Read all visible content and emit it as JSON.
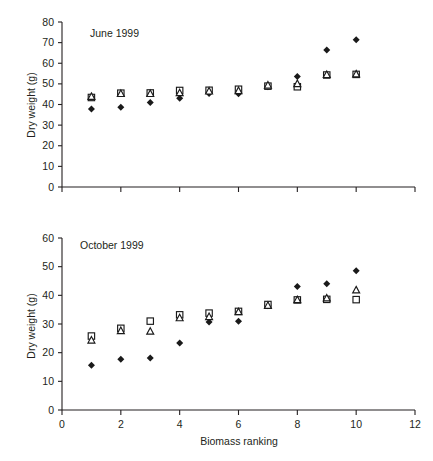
{
  "figure": {
    "background": "#ffffff",
    "ink_color": "#231f20",
    "marker_color": "#1a1a1a"
  },
  "chart_data": [
    {
      "type": "scatter",
      "panel_id": "top",
      "title": "June 1999",
      "xlabel": "",
      "ylabel": "Dry weight (g)",
      "xlim": [
        0,
        12
      ],
      "ylim": [
        0,
        80
      ],
      "xticks": [
        0,
        2,
        4,
        6,
        8,
        10,
        12
      ],
      "xticklabels": [
        "",
        "",
        "",
        "",
        "",
        "",
        ""
      ],
      "yticks": [
        0,
        10,
        20,
        30,
        40,
        50,
        60,
        70,
        80
      ],
      "yticklabels": [
        "0",
        "10",
        "20",
        "30",
        "40",
        "50",
        "60",
        "70",
        "80"
      ],
      "grid": false,
      "legend": "none",
      "x": [
        1,
        2,
        3,
        4,
        5,
        6,
        7,
        8,
        9,
        10
      ],
      "series": [
        {
          "name": "filled-diamond",
          "marker": "diamond-filled",
          "values": [
            37.8,
            38.7,
            41.0,
            43.0,
            45.3,
            45.2,
            48.6,
            53.6,
            66.4,
            71.4
          ]
        },
        {
          "name": "open-square",
          "marker": "square-open",
          "values": [
            43.4,
            45.5,
            45.6,
            46.8,
            46.9,
            47.4,
            48.9,
            48.6,
            54.3,
            54.6
          ]
        },
        {
          "name": "open-triangle",
          "marker": "triangle-open",
          "values": [
            43.8,
            45.2,
            45.2,
            45.6,
            46.4,
            46.6,
            49.3,
            50.0,
            54.4,
            54.7
          ]
        }
      ]
    },
    {
      "type": "scatter",
      "panel_id": "bottom",
      "title": "October 1999",
      "xlabel": "Biomass ranking",
      "ylabel": "Dry weight (g)",
      "xlim": [
        0,
        12
      ],
      "ylim": [
        0,
        60
      ],
      "xticks": [
        0,
        2,
        4,
        6,
        8,
        10,
        12
      ],
      "xticklabels": [
        "0",
        "2",
        "4",
        "6",
        "8",
        "10",
        "12"
      ],
      "yticks": [
        0,
        10,
        20,
        30,
        40,
        50,
        60
      ],
      "yticklabels": [
        "0",
        "10",
        "20",
        "30",
        "40",
        "50",
        "60"
      ],
      "grid": false,
      "legend": "none",
      "x": [
        1,
        2,
        3,
        4,
        5,
        6,
        7,
        8,
        9,
        10
      ],
      "series": [
        {
          "name": "filled-diamond",
          "marker": "diamond-filled",
          "values": [
            15.6,
            17.7,
            18.1,
            23.4,
            30.7,
            31.0,
            36.4,
            43.1,
            44.0,
            48.6
          ]
        },
        {
          "name": "open-square",
          "marker": "square-open",
          "values": [
            25.8,
            28.5,
            31.0,
            33.2,
            33.8,
            34.4,
            36.8,
            38.4,
            38.6,
            38.5
          ]
        },
        {
          "name": "open-triangle",
          "marker": "triangle-open",
          "values": [
            24.3,
            27.6,
            27.4,
            32.1,
            32.5,
            34.2,
            36.4,
            38.4,
            39.0,
            41.8
          ]
        }
      ]
    }
  ]
}
